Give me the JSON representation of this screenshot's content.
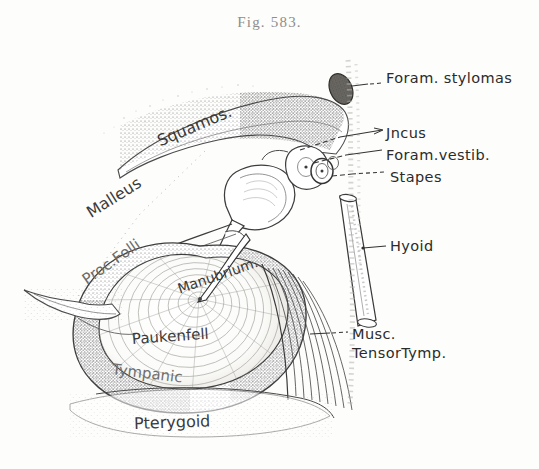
{
  "figure": {
    "caption": "Fig. 583.",
    "style": "engraved stipple anatomical plate",
    "ink_color": "#3a3a3a",
    "paper_color": "#fdfdfb"
  },
  "callout_labels": [
    {
      "id": "foram-stylomas",
      "text": "Foram. stylomas",
      "x": 386,
      "y": 78
    },
    {
      "id": "incus",
      "text": "Jncus",
      "x": 386,
      "y": 133
    },
    {
      "id": "foram-vestib",
      "text": "Foram.vestib.",
      "x": 386,
      "y": 155
    },
    {
      "id": "stapes",
      "text": "Stapes",
      "x": 390,
      "y": 177
    },
    {
      "id": "hyoid",
      "text": "Hyoid",
      "x": 390,
      "y": 246
    },
    {
      "id": "musc-tensor-1",
      "text": "Musc.",
      "x": 352,
      "y": 334
    },
    {
      "id": "musc-tensor-2",
      "text": "TensorTymp.",
      "x": 352,
      "y": 353
    }
  ],
  "figure_labels": [
    {
      "id": "squamos",
      "text": "Squamos.",
      "x": 158,
      "y": 132,
      "rot": -23,
      "size": 16
    },
    {
      "id": "malleus",
      "text": "Malleus",
      "x": 88,
      "y": 204,
      "rot": -32,
      "size": 16
    },
    {
      "id": "proc-folli",
      "text": "Proc.Folli",
      "x": 84,
      "y": 272,
      "rot": -35,
      "size": 15
    },
    {
      "id": "manubrium",
      "text": "Manubrium.",
      "x": 178,
      "y": 281,
      "rot": -19,
      "size": 14
    },
    {
      "id": "paukenfell",
      "text": "Paukenfell",
      "x": 132,
      "y": 330,
      "rot": -4,
      "size": 15
    },
    {
      "id": "tympanic",
      "text": "Tympanic",
      "x": 112,
      "y": 360,
      "rot": 7,
      "size": 15
    },
    {
      "id": "pterygoid",
      "text": "Pterygoid",
      "x": 134,
      "y": 414,
      "rot": -2,
      "size": 16
    }
  ]
}
